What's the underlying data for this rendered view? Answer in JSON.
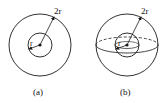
{
  "figure_a": {
    "caption": "(a)",
    "outer_label": "2r",
    "inner_label": "r",
    "center": [
      40,
      45
    ],
    "outer_radius": 31,
    "inner_radius": 12
  },
  "figure_b": {
    "caption": "(b)",
    "outer_label": "2r",
    "inner_label": "r",
    "center": [
      127,
      45
    ],
    "outer_radius": 31,
    "inner_radius": 12
  },
  "colors": {
    "stroke": "#1a1a1a",
    "background": "#ffffff"
  }
}
